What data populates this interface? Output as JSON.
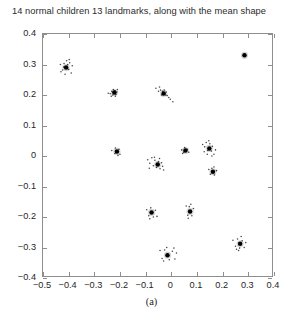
{
  "chart_data": {
    "type": "scatter",
    "title": "14 normal children 13 landmarks, along with the mean shape",
    "caption": "(a)",
    "xlabel": "",
    "ylabel": "",
    "xlim": [
      -0.5,
      0.4
    ],
    "ylim": [
      -0.4,
      0.4
    ],
    "xticks": [
      -0.5,
      -0.4,
      -0.3,
      -0.2,
      -0.1,
      0,
      0.1,
      0.2,
      0.3,
      0.4
    ],
    "yticks": [
      -0.4,
      -0.3,
      -0.2,
      -0.1,
      0,
      0.1,
      0.2,
      0.3,
      0.4
    ],
    "xtick_labels": [
      "-0.5",
      "-0.4",
      "-0.3",
      "-0.2",
      "-0.1",
      "0",
      "0.1",
      "0.2",
      "0.3",
      "0.4"
    ],
    "ytick_labels": [
      "-0.4",
      "-0.3",
      "-0.2",
      "-0.1",
      "0",
      "0.1",
      "0.2",
      "0.3",
      "0.4"
    ],
    "grid": false,
    "legend": null,
    "n_subjects": 14,
    "n_landmarks": 13,
    "marker_color": "#000000",
    "mean_marker": "filled-dot",
    "individual_marker": "small-dot",
    "series": [
      {
        "name": "mean shape",
        "marker": "large-dot",
        "points": [
          {
            "x": -0.41,
            "y": 0.29
          },
          {
            "x": -0.222,
            "y": 0.208
          },
          {
            "x": -0.03,
            "y": 0.205
          },
          {
            "x": 0.285,
            "y": 0.33
          },
          {
            "x": -0.212,
            "y": 0.015
          },
          {
            "x": 0.055,
            "y": 0.018
          },
          {
            "x": 0.148,
            "y": 0.025
          },
          {
            "x": -0.053,
            "y": -0.028
          },
          {
            "x": 0.162,
            "y": -0.052
          },
          {
            "x": -0.077,
            "y": -0.185
          },
          {
            "x": 0.073,
            "y": -0.182
          },
          {
            "x": 0.268,
            "y": -0.288
          },
          {
            "x": -0.015,
            "y": -0.325
          }
        ]
      },
      {
        "name": "individual children landmarks",
        "marker": "small-dot",
        "points": [
          {
            "x": -0.432,
            "y": 0.3
          },
          {
            "x": -0.424,
            "y": 0.282
          },
          {
            "x": -0.418,
            "y": 0.303
          },
          {
            "x": -0.404,
            "y": 0.3
          },
          {
            "x": -0.4,
            "y": 0.284
          },
          {
            "x": -0.396,
            "y": 0.306
          },
          {
            "x": -0.39,
            "y": 0.272
          },
          {
            "x": -0.43,
            "y": 0.276
          },
          {
            "x": -0.408,
            "y": 0.312
          },
          {
            "x": -0.386,
            "y": 0.296
          },
          {
            "x": -0.414,
            "y": 0.268
          },
          {
            "x": -0.398,
            "y": 0.316
          },
          {
            "x": -0.42,
            "y": 0.292
          },
          {
            "x": -0.246,
            "y": 0.206
          },
          {
            "x": -0.238,
            "y": 0.204
          },
          {
            "x": -0.232,
            "y": 0.212
          },
          {
            "x": -0.228,
            "y": 0.2
          },
          {
            "x": -0.22,
            "y": 0.214
          },
          {
            "x": -0.216,
            "y": 0.202
          },
          {
            "x": -0.212,
            "y": 0.21
          },
          {
            "x": -0.226,
            "y": 0.218
          },
          {
            "x": -0.218,
            "y": 0.196
          },
          {
            "x": -0.234,
            "y": 0.196
          },
          {
            "x": -0.21,
            "y": 0.218
          },
          {
            "x": -0.06,
            "y": 0.222
          },
          {
            "x": -0.05,
            "y": 0.212
          },
          {
            "x": -0.042,
            "y": 0.216
          },
          {
            "x": -0.034,
            "y": 0.212
          },
          {
            "x": -0.028,
            "y": 0.216
          },
          {
            "x": -0.022,
            "y": 0.2
          },
          {
            "x": -0.016,
            "y": 0.198
          },
          {
            "x": -0.01,
            "y": 0.192
          },
          {
            "x": -0.004,
            "y": 0.186
          },
          {
            "x": 0.006,
            "y": 0.178
          },
          {
            "x": -0.038,
            "y": 0.2
          },
          {
            "x": -0.046,
            "y": 0.226
          },
          {
            "x": -0.02,
            "y": 0.21
          },
          {
            "x": -0.232,
            "y": 0.018
          },
          {
            "x": -0.22,
            "y": 0.008
          },
          {
            "x": -0.204,
            "y": 0.022
          },
          {
            "x": -0.2,
            "y": 0.006
          },
          {
            "x": -0.218,
            "y": 0.026
          },
          {
            "x": -0.208,
            "y": 0.002
          },
          {
            "x": 0.04,
            "y": 0.02
          },
          {
            "x": 0.048,
            "y": 0.012
          },
          {
            "x": 0.062,
            "y": 0.022
          },
          {
            "x": 0.068,
            "y": 0.012
          },
          {
            "x": 0.052,
            "y": 0.028
          },
          {
            "x": 0.044,
            "y": 0.008
          },
          {
            "x": 0.122,
            "y": 0.038
          },
          {
            "x": 0.13,
            "y": 0.03
          },
          {
            "x": 0.136,
            "y": 0.044
          },
          {
            "x": 0.142,
            "y": 0.018
          },
          {
            "x": 0.15,
            "y": 0.04
          },
          {
            "x": 0.156,
            "y": 0.016
          },
          {
            "x": 0.16,
            "y": 0.032
          },
          {
            "x": 0.166,
            "y": 0.006
          },
          {
            "x": 0.172,
            "y": 0.02
          },
          {
            "x": 0.128,
            "y": 0.014
          },
          {
            "x": 0.146,
            "y": 0.05
          },
          {
            "x": 0.158,
            "y": 0.0
          },
          {
            "x": 0.14,
            "y": 0.006
          },
          {
            "x": -0.092,
            "y": -0.012
          },
          {
            "x": -0.084,
            "y": -0.024
          },
          {
            "x": -0.076,
            "y": -0.006
          },
          {
            "x": -0.07,
            "y": -0.032
          },
          {
            "x": -0.064,
            "y": -0.014
          },
          {
            "x": -0.058,
            "y": -0.038
          },
          {
            "x": -0.05,
            "y": -0.018
          },
          {
            "x": -0.044,
            "y": -0.042
          },
          {
            "x": -0.038,
            "y": -0.022
          },
          {
            "x": -0.03,
            "y": -0.046
          },
          {
            "x": -0.086,
            "y": -0.04
          },
          {
            "x": -0.066,
            "y": -0.004
          },
          {
            "x": -0.046,
            "y": -0.008
          },
          {
            "x": -0.034,
            "y": -0.034
          },
          {
            "x": 0.146,
            "y": -0.044
          },
          {
            "x": 0.152,
            "y": -0.06
          },
          {
            "x": 0.158,
            "y": -0.04
          },
          {
            "x": 0.168,
            "y": -0.062
          },
          {
            "x": 0.176,
            "y": -0.048
          },
          {
            "x": 0.166,
            "y": -0.036
          },
          {
            "x": -0.096,
            "y": -0.176
          },
          {
            "x": -0.088,
            "y": -0.196
          },
          {
            "x": -0.08,
            "y": -0.17
          },
          {
            "x": -0.07,
            "y": -0.2
          },
          {
            "x": -0.062,
            "y": -0.178
          },
          {
            "x": -0.056,
            "y": -0.198
          },
          {
            "x": -0.084,
            "y": -0.206
          },
          {
            "x": 0.058,
            "y": -0.164
          },
          {
            "x": 0.064,
            "y": -0.194
          },
          {
            "x": 0.07,
            "y": -0.166
          },
          {
            "x": 0.08,
            "y": -0.196
          },
          {
            "x": 0.086,
            "y": -0.172
          },
          {
            "x": 0.066,
            "y": -0.204
          },
          {
            "x": 0.076,
            "y": -0.158
          },
          {
            "x": 0.24,
            "y": -0.276
          },
          {
            "x": 0.25,
            "y": -0.296
          },
          {
            "x": 0.258,
            "y": -0.272
          },
          {
            "x": 0.266,
            "y": -0.302
          },
          {
            "x": 0.276,
            "y": -0.278
          },
          {
            "x": 0.284,
            "y": -0.3
          },
          {
            "x": 0.29,
            "y": -0.284
          },
          {
            "x": 0.254,
            "y": -0.306
          },
          {
            "x": 0.272,
            "y": -0.264
          },
          {
            "x": 0.262,
            "y": -0.31
          },
          {
            "x": -0.044,
            "y": -0.31
          },
          {
            "x": -0.036,
            "y": -0.336
          },
          {
            "x": -0.026,
            "y": -0.308
          },
          {
            "x": -0.008,
            "y": -0.34
          },
          {
            "x": 0.004,
            "y": -0.312
          },
          {
            "x": 0.014,
            "y": -0.338
          },
          {
            "x": 0.02,
            "y": -0.318
          },
          {
            "x": -0.03,
            "y": -0.344
          },
          {
            "x": 0.01,
            "y": -0.302
          },
          {
            "x": -0.018,
            "y": -0.3
          }
        ]
      }
    ]
  }
}
